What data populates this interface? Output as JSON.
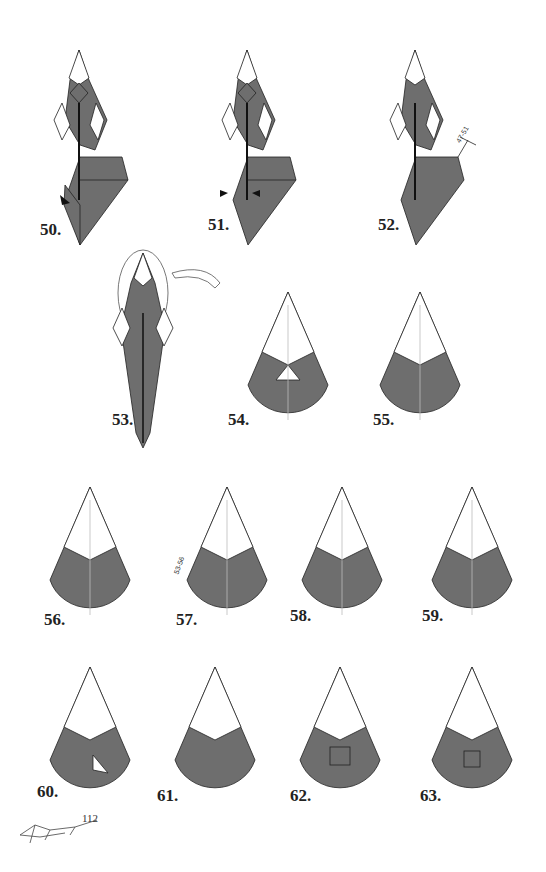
{
  "page": {
    "page_number": "112",
    "colors": {
      "paper_dark": "#6e6e6e",
      "paper_light": "#ffffff",
      "line": "#222222"
    }
  },
  "steps": [
    {
      "label": "50."
    },
    {
      "label": "51."
    },
    {
      "label": "52.",
      "reference": "47-51"
    },
    {
      "label": "53."
    },
    {
      "label": "54."
    },
    {
      "label": "55."
    },
    {
      "label": "56."
    },
    {
      "label": "57.",
      "reference": "53-56"
    },
    {
      "label": "58."
    },
    {
      "label": "59."
    },
    {
      "label": "60."
    },
    {
      "label": "61."
    },
    {
      "label": "62."
    },
    {
      "label": "63."
    }
  ]
}
